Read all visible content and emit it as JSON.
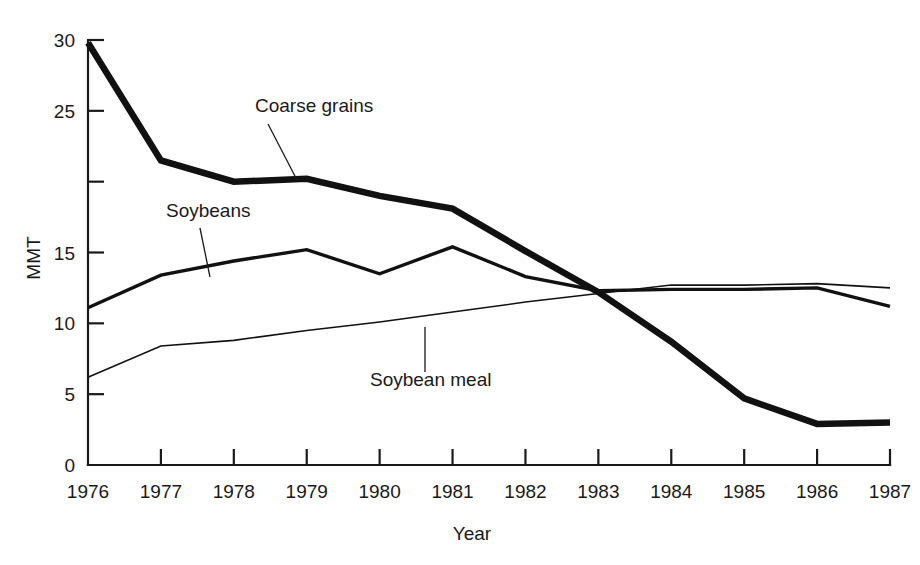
{
  "chart_data": {
    "type": "line",
    "title": "",
    "xlabel": "Year",
    "ylabel": "MMT",
    "x": [
      1976,
      1977,
      1978,
      1979,
      1980,
      1981,
      1982,
      1983,
      1984,
      1985,
      1986,
      1987
    ],
    "xtick_labels": [
      "1976",
      "1977",
      "1978",
      "1979",
      "1980",
      "1981",
      "1982",
      "1983",
      "1984",
      "1985",
      "1986",
      "1987"
    ],
    "ytick_values": [
      0,
      5,
      10,
      15,
      20,
      25,
      30
    ],
    "ytick_labels": [
      "0",
      "5",
      "10",
      "15",
      "",
      "25",
      "30"
    ],
    "ylim": [
      0,
      30
    ],
    "xlim": [
      1976,
      1987
    ],
    "grid": false,
    "legend": "none",
    "series": [
      {
        "name": "Coarse grains",
        "label": "Coarse grains",
        "color": "#111111",
        "line_width": 6.5,
        "values": [
          29.8,
          21.5,
          20.0,
          20.2,
          19.0,
          18.1,
          15.1,
          12.2,
          8.7,
          4.7,
          2.9,
          3.0
        ]
      },
      {
        "name": "Soybeans",
        "label": "Soybeans",
        "color": "#111111",
        "line_width": 3.4,
        "values": [
          11.1,
          13.4,
          14.4,
          15.2,
          13.5,
          15.4,
          13.3,
          12.3,
          12.4,
          12.4,
          12.5,
          11.2
        ]
      },
      {
        "name": "Soybean meal",
        "label": "Soybean meal",
        "color": "#1a1a1a",
        "line_width": 1.6,
        "values": [
          6.2,
          8.4,
          8.8,
          9.5,
          10.1,
          10.8,
          11.5,
          12.1,
          12.7,
          12.7,
          12.8,
          12.5
        ]
      }
    ],
    "annotations": [
      {
        "name": "coarse-grains",
        "text": "Coarse grains",
        "text_x": 255,
        "text_y": 112,
        "leader_from_x": 268,
        "leader_from_y": 124,
        "leader_to_x": 297,
        "leader_to_y": 180
      },
      {
        "name": "soybeans",
        "text": "Soybeans",
        "text_x": 166,
        "text_y": 217,
        "leader_from_x": 200,
        "leader_from_y": 228,
        "leader_to_x": 210,
        "leader_to_y": 277
      },
      {
        "name": "soybean-meal",
        "text": "Soybean meal",
        "text_x": 370,
        "text_y": 386,
        "leader_from_x": 425,
        "leader_from_y": 372,
        "leader_to_x": 425,
        "leader_to_y": 327
      }
    ]
  },
  "axes": {
    "y_axis_title": "MMT",
    "x_axis_title": "Year"
  }
}
